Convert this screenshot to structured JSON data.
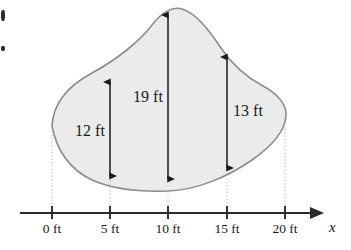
{
  "figure": {
    "colors": {
      "region_fill": "#ebebeb",
      "region_stroke": "#8c8c8c",
      "axis": "#2b2b2b",
      "arrow": "#1a1a1a",
      "dotted_guide": "#b3b3b3",
      "text": "#1a1a1a",
      "background": "#ffffff"
    },
    "axis": {
      "name": "x",
      "unit": "ft",
      "line_y": 213,
      "start_x": 20,
      "end_x": 326,
      "ticks": [
        {
          "value": 0,
          "label": "0 ft",
          "x": 52
        },
        {
          "value": 5,
          "label": "5 ft",
          "x": 110
        },
        {
          "value": 10,
          "label": "10 ft",
          "x": 168
        },
        {
          "value": 15,
          "label": "15 ft",
          "x": 227
        },
        {
          "value": 20,
          "label": "20 ft",
          "x": 285
        }
      ]
    },
    "measurements": [
      {
        "id": "width-at-5ft",
        "label": "12 ft",
        "value": 12,
        "unit": "ft",
        "at_x_ft": 5,
        "x": 110,
        "y_top": 78,
        "y_bottom": 180,
        "label_x": 90,
        "label_y": 122,
        "label_side": "left"
      },
      {
        "id": "width-at-10ft",
        "label": "19 ft",
        "value": 19,
        "unit": "ft",
        "at_x_ft": 10,
        "x": 168,
        "y_top": 11,
        "y_bottom": 183,
        "label_x": 148,
        "label_y": 88,
        "label_side": "left"
      },
      {
        "id": "width-at-15ft",
        "label": "13 ft",
        "value": 13,
        "unit": "ft",
        "at_x_ft": 15,
        "x": 227,
        "y_top": 53,
        "y_bottom": 172,
        "label_x": 248,
        "label_y": 102,
        "label_side": "right"
      }
    ],
    "guides": [
      {
        "id": "guide-0ft",
        "x": 52,
        "y_top": 128,
        "y_bottom": 213
      },
      {
        "id": "guide-5ft",
        "x": 110,
        "y_top": 180,
        "y_bottom": 213
      },
      {
        "id": "guide-10ft",
        "x": 168,
        "y_top": 190,
        "y_bottom": 213
      },
      {
        "id": "guide-15ft",
        "x": 227,
        "y_top": 175,
        "y_bottom": 213
      },
      {
        "id": "guide-20ft",
        "x": 285,
        "y_top": 122,
        "y_bottom": 213
      }
    ],
    "region_path": "M 52 126 C 53 104 68 86 92 73 C 116 60 139 42 152 25 C 161 13 172 6 182 9 C 196 13 209 30 221 48 C 233 66 248 78 263 86 C 278 94 287 105 286 116 C 285 131 272 146 252 160 C 229 176 198 190 168 191 C 138 192 112 189 92 180 C 71 170 57 152 52 126 Z"
  }
}
